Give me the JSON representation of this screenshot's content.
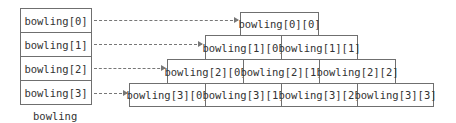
{
  "left_array": {
    "caption": "bowling",
    "cells": [
      "bowling[0]",
      "bowling[1]",
      "bowling[2]",
      "bowling[3]"
    ]
  },
  "rows": [
    {
      "cells": [
        "bowling[0][0]"
      ]
    },
    {
      "cells": [
        "bowling[1][0]",
        "bowling[1][1]"
      ]
    },
    {
      "cells": [
        "bowling[2][0]",
        "bowling[2][1]",
        "bowling[2][2]"
      ]
    },
    {
      "cells": [
        "bowling[3][0]",
        "bowling[3][1]",
        "bowling[3][2]",
        "bowling[3][3]"
      ]
    }
  ]
}
